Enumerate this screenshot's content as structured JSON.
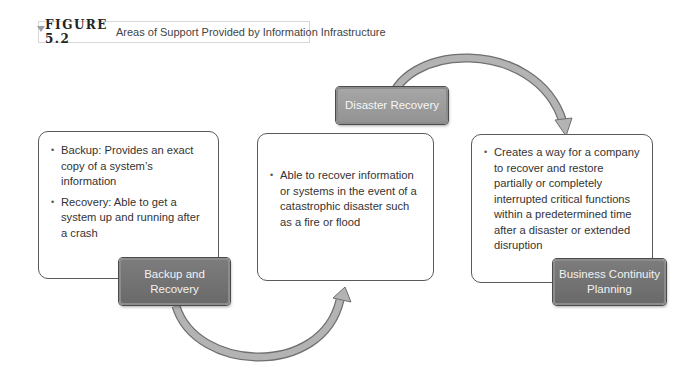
{
  "figure": {
    "number": "FIGURE 5.2",
    "caption": "Areas of Support Provided by Information Infrastructure"
  },
  "nodes": [
    {
      "label": "Backup and Recovery",
      "label_lines": [
        "Backup and",
        "Recovery"
      ],
      "bullets": [
        "Backup: Provides an exact copy of a system’s information",
        "Recovery: Able to get a system up and running after a crash"
      ]
    },
    {
      "label": "Disaster Recovery",
      "label_lines": [
        "Disaster Recovery"
      ],
      "bullets": [
        "Able to recover information or systems in the event of a catastrophic disaster such as a fire or flood"
      ]
    },
    {
      "label": "Business Continuity Planning",
      "label_lines": [
        "Business Continuity",
        "Planning"
      ],
      "bullets": [
        "Creates a way for a company to recover and restore partially or completely interrupted critical functions within a predetermined time after a disaster or extended disruption"
      ]
    }
  ],
  "connections": [
    {
      "from": "Backup and Recovery",
      "to": "Disaster Recovery"
    },
    {
      "from": "Disaster Recovery",
      "to": "Business Continuity Planning"
    }
  ],
  "colors": {
    "label_fill": "#727272",
    "label_fill_light": "#9c9c9c",
    "arrow_fill": "#b3b3b3",
    "arrow_stroke": "#6f6f6f",
    "card_border": "#5a5a5a"
  }
}
